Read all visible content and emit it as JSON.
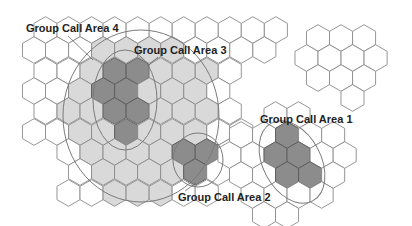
{
  "diagram": {
    "hex": {
      "radius": 13.3,
      "row_spacing": 20.3
    },
    "colors": {
      "background": "#ffffff",
      "hex_stroke": "#8a8a8a",
      "light_fill": "#d9d9d9",
      "dark_fill": "#8c8c8c",
      "outline": "#7a7a7a"
    },
    "labels": {
      "area4": "Group Call Area 4",
      "area3": "Group Call Area 3",
      "area2": "Group Call Area 2",
      "area1": "Group Call Area 1"
    },
    "areas": [
      {
        "id": "area4",
        "shape": "ellipse",
        "cx": 141,
        "cy": 116,
        "rx": 78,
        "ry": 86,
        "rotate": 0
      },
      {
        "id": "area3",
        "shape": "ellipse",
        "cx": 125,
        "cy": 100,
        "rx": 32,
        "ry": 50,
        "rotate": 0
      },
      {
        "id": "area2",
        "shape": "ellipse",
        "cx": 198,
        "cy": 160,
        "rx": 25,
        "ry": 27,
        "rotate": 0
      },
      {
        "id": "area1",
        "shape": "ellipse",
        "cx": 292,
        "cy": 162,
        "rx": 29,
        "ry": 44,
        "rotate": -28
      }
    ],
    "label_positions": {
      "area4": {
        "x": 26,
        "y": 32,
        "leader": [
          68,
          36,
          93,
          60
        ]
      },
      "area3": {
        "x": 134,
        "y": 54,
        "leader": [
          158,
          57,
          148,
          66
        ]
      },
      "area2": {
        "x": 178,
        "y": 201,
        "leader": [
          185,
          191,
          196,
          183
        ]
      },
      "area1": {
        "x": 260,
        "y": 123,
        "leader": null
      }
    },
    "clusters": [
      {
        "name": "main-grid",
        "rows": [
          {
            "y": 30,
            "x0": 45.5,
            "count": 11
          },
          {
            "y": 50,
            "x0": 34,
            "count": 11
          },
          {
            "y": 71,
            "x0": 45.5,
            "count": 9
          },
          {
            "y": 91,
            "x0": 34,
            "count": 9
          },
          {
            "y": 111,
            "x0": 45.5,
            "count": 9
          },
          {
            "y": 132,
            "x0": 34,
            "count": 10
          },
          {
            "y": 152,
            "x0": 68.5,
            "count": 8
          },
          {
            "y": 172,
            "x0": 80,
            "count": 8
          },
          {
            "y": 193,
            "x0": 68.5,
            "count": 7
          }
        ],
        "light_area": "area4",
        "dark_cells": [
          [
            114.5,
            71
          ],
          [
            137.5,
            71
          ],
          [
            103,
            91
          ],
          [
            126,
            91
          ],
          [
            114.5,
            111
          ],
          [
            137.5,
            111
          ],
          [
            126,
            132
          ],
          [
            183.5,
            152
          ],
          [
            206.5,
            152
          ],
          [
            195,
            172
          ]
        ]
      },
      {
        "name": "top-right-cluster",
        "rows": [
          {
            "y": 38,
            "x0": 318,
            "count": 3
          },
          {
            "y": 58,
            "x0": 306.5,
            "count": 4
          },
          {
            "y": 78,
            "x0": 318,
            "count": 3
          },
          {
            "y": 98,
            "x0": 352.5,
            "count": 1
          }
        ],
        "light_area": null,
        "dark_cells": []
      },
      {
        "name": "area1-cluster",
        "rows": [
          {
            "y": 115,
            "x0": 275.5,
            "count": 2
          },
          {
            "y": 135,
            "x0": 241,
            "count": 5
          },
          {
            "y": 155,
            "x0": 229.5,
            "count": 6
          },
          {
            "y": 175,
            "x0": 241,
            "count": 5
          },
          {
            "y": 195,
            "x0": 252.5,
            "count": 4
          },
          {
            "y": 215,
            "x0": 264,
            "count": 2
          }
        ],
        "light_area": null,
        "dark_cells": [
          [
            287,
            135
          ],
          [
            275.5,
            155
          ],
          [
            298.5,
            155
          ],
          [
            287,
            175
          ],
          [
            310,
            175
          ]
        ]
      }
    ]
  }
}
